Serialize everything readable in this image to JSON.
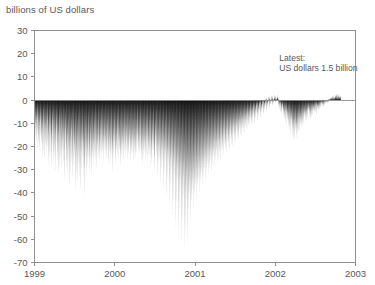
{
  "chart_data": {
    "type": "area",
    "title": "billions of US dollars",
    "xlabel": "",
    "ylabel": "billions of US dollars",
    "ylim": [
      -70,
      30
    ],
    "xlim": [
      1999,
      2003
    ],
    "grid": false,
    "legend": null,
    "yticks": [
      30,
      20,
      10,
      0,
      -10,
      -20,
      -30,
      -40,
      -50,
      -60,
      -70
    ],
    "ytick_labels": [
      "30",
      "20",
      "10",
      "0",
      "-10",
      "-20",
      "-30",
      "-40",
      "-50",
      "-60",
      "-70"
    ],
    "xticks": [
      1999,
      2000,
      2001,
      2002,
      2003
    ],
    "xtick_labels": [
      "1999",
      "2000",
      "2001",
      "2002",
      "2003"
    ],
    "series_color": "#121212",
    "axis_color": "#8e8f91",
    "text_color": "#58585a",
    "annotations": [
      {
        "name": "latest-value-annotation",
        "line1": "Latest:",
        "line2": "US dollars 1.5 billion",
        "x": 2002.05,
        "y": 17
      }
    ],
    "series": [
      {
        "name": "net position",
        "values": [
          -11.2,
          -14.6,
          -9.8,
          -17.3,
          -12.1,
          -20.4,
          -8.6,
          -15.9,
          -22.8,
          -10.3,
          -18.7,
          -13.2,
          -24.1,
          -9.4,
          -16.8,
          -21.3,
          -12.7,
          -19.5,
          -26.2,
          -14.8,
          -10.6,
          -23.4,
          -17.9,
          -13.5,
          -28.1,
          -11.9,
          -20.8,
          -15.2,
          -25.6,
          -18.3,
          -9.7,
          -22.1,
          -30.4,
          -16.5,
          -12.3,
          -27.8,
          -19.2,
          -14.1,
          -24.9,
          -31.6,
          -17.4,
          -10.9,
          -21.7,
          -29.3,
          -15.8,
          -23.2,
          -13.6,
          -26.5,
          -18.9,
          -33.1,
          -20.3,
          -12.8,
          -28.6,
          -16.2,
          -24.4,
          -35.2,
          -19.7,
          -14.5,
          -30.8,
          -22.6,
          -17.1,
          -27.3,
          -11.4,
          -32.7,
          -20.9,
          -25.1,
          -15.6,
          -29.8,
          -18.4,
          -23.7,
          -37.3,
          -21.2,
          -13.9,
          -31.5,
          -26.8,
          -19.1,
          -34.6,
          -16.7,
          -28.2,
          -22.4,
          -40.1,
          -24.3,
          -17.8,
          -33.9,
          -20.6,
          -29.4,
          -15.3,
          -36.7,
          -25.8,
          -21.1,
          -18.6,
          -31.2,
          -27.5,
          -23.9,
          -42.3,
          -19.4,
          -34.1,
          -26.2,
          -22.7,
          -38.5,
          -17.2,
          -29.9,
          -24.6,
          -20.1,
          -35.8,
          -27.1,
          -23.3,
          -41.7,
          -18.8,
          -32.4,
          -26.9,
          -21.5,
          -37.2,
          -24.8,
          -19.6,
          -30.3,
          -44.6,
          -22.9,
          -28.7,
          -25.4,
          -20.8,
          -36.1,
          -31.7,
          -23.6,
          -27.2,
          -19.9,
          -33.5,
          -26.4,
          -22.1,
          -29.6,
          -18.3,
          -24.9,
          -35.4,
          -21.7,
          -27.8,
          -23.2,
          -30.9,
          -19.2,
          -26.1,
          -22.5,
          -17.6,
          -28.3,
          -24.7,
          -20.4,
          -32.1,
          -25.9,
          -21.8,
          -18.1,
          -27.4,
          -23.8,
          -29.2,
          -19.7,
          -25.3,
          -21.2,
          -16.9,
          -26.8,
          -22.4,
          -18.6,
          -24.1,
          -20.7,
          -28.9,
          -23.5,
          -19.3,
          -25.7,
          -21.4,
          -17.8,
          -27.6,
          -22.9,
          -18.4,
          -24.3,
          -30.6,
          -20.9,
          -26.2,
          -22.1,
          -17.5,
          -28.4,
          -23.7,
          -19.8,
          -25.1,
          -21.6,
          -33.8,
          -24.5,
          -20.2,
          -27.9,
          -23.1,
          -18.9,
          -26.5,
          -22.3,
          -29.7,
          -24.8,
          -20.5,
          -16.4,
          -25.6,
          -21.9,
          -18.2,
          -27.1,
          -23.4,
          -19.5,
          -24.9,
          -31.3,
          -20.8,
          -26.7,
          -22.6,
          -18.7,
          -25.2,
          -21.3,
          -28.1,
          -24.2,
          -19.9,
          -15.8,
          -26.3,
          -22.8,
          -18.5,
          -23.9,
          -20.6,
          -27.5,
          -24.1,
          -19.2,
          -25.8,
          -21.7,
          -17.3,
          -28.6,
          -23.2,
          -19.6,
          -26.1,
          -22.4,
          -18.1,
          -24.7,
          -20.3,
          -29.4,
          -25.5,
          -21.1,
          -17.7,
          -23.6,
          -27.2,
          -19.4,
          -24.4,
          -20.9,
          -16.5,
          -26.9,
          -22.2,
          -18.8,
          -25.3,
          -21.5,
          -17.1,
          -23.8,
          -28.3,
          -19.7,
          -24.6,
          -20.1,
          -30.7,
          -26.4,
          -22.7,
          -18.3,
          -24.2,
          -20.8,
          -27.6,
          -23.1,
          -19.5,
          -25.9,
          -21.2,
          -17.4,
          -29.1,
          -24.8,
          -20.6,
          -26.2,
          -22.5,
          -18.9,
          -25.4,
          -31.8,
          -21.6,
          -27.3,
          -23.7,
          -19.1,
          -24.5,
          -20.4,
          -28.7,
          -33.2,
          -25.1,
          -21.8,
          -17.9,
          -26.6,
          -22.3,
          -35.7,
          -19.8,
          -24.9,
          -30.2,
          -21.4,
          -27.8,
          -23.5,
          -38.1,
          -19.3,
          -25.7,
          -32.6,
          -22.9,
          -28.4,
          -24.2,
          -41.3,
          -20.7,
          -26.3,
          -34.8,
          -23.1,
          -29.5,
          -25.2,
          -44.7,
          -21.9,
          -27.1,
          -37.4,
          -24.6,
          -30.8,
          -26.1,
          -48.2,
          -22.4,
          -28.9,
          -40.6,
          -25.3,
          -33.1,
          -27.7,
          -52.4,
          -23.8,
          -31.2,
          -44.9,
          -26.5,
          -35.6,
          -29.1,
          -57.3,
          -24.7,
          -33.8,
          -48.1,
          -28.2,
          -38.4,
          -31.5,
          -61.2,
          -26.9,
          -36.7,
          -51.8,
          -30.3,
          -42.1,
          -33.9,
          -64.8,
          -28.6,
          -39.2,
          -55.4,
          -32.7,
          -45.3,
          -36.1,
          -66.9,
          -30.1,
          -41.8,
          -58.2,
          -34.5,
          -47.6,
          -38.3,
          -63.1,
          -31.7,
          -43.2,
          -52.9,
          -36.4,
          -44.8,
          -39.7,
          -56.3,
          -33.2,
          -45.1,
          -48.7,
          -37.9,
          -42.6,
          -35.8,
          -50.4,
          -32.1,
          -41.3,
          -44.2,
          -36.7,
          -39.8,
          -33.4,
          -46.9,
          -30.8,
          -38.2,
          -41.6,
          -34.9,
          -37.1,
          -31.2,
          -43.4,
          -29.6,
          -35.8,
          -38.9,
          -32.3,
          -34.7,
          -28.9,
          -40.2,
          -27.4,
          -33.1,
          -36.5,
          -30.2,
          -32.8,
          -26.7,
          -37.6,
          -25.3,
          -31.4,
          -34.2,
          -28.1,
          -30.6,
          -24.8,
          -35.1,
          -23.6,
          -29.2,
          -32.4,
          -26.3,
          -28.7,
          -22.9,
          -33.5,
          -21.7,
          -27.4,
          -30.8,
          -24.6,
          -26.9,
          -21.2,
          -31.6,
          -20.4,
          -25.8,
          -28.3,
          -23.1,
          -25.2,
          -19.8,
          -29.7,
          -18.6,
          -24.1,
          -26.8,
          -21.5,
          -23.6,
          -18.2,
          -27.9,
          -17.4,
          -22.8,
          -25.1,
          -20.3,
          -22.1,
          -16.9,
          -26.2,
          -16.1,
          -21.4,
          -23.7,
          -18.8,
          -20.6,
          -15.7,
          -24.8,
          -14.9,
          -19.8,
          -22.3,
          -17.4,
          -19.1,
          -14.3,
          -23.1,
          -13.6,
          -18.2,
          -20.9,
          -16.1,
          -17.8,
          -13.1,
          -21.7,
          -12.4,
          -16.8,
          -19.4,
          -14.7,
          -16.3,
          -11.8,
          -20.2,
          -11.2,
          -15.4,
          -17.9,
          -13.2,
          -14.9,
          -10.6,
          -18.7,
          -10.1,
          -14.1,
          -16.3,
          -11.8,
          -13.4,
          -9.3,
          -17.2,
          -8.7,
          -12.6,
          -14.8,
          -10.4,
          -12.1,
          -8.1,
          -15.6,
          -7.4,
          -11.2,
          -13.3,
          -9.1,
          -10.7,
          -6.8,
          -14.1,
          -6.2,
          -9.8,
          -11.9,
          -7.6,
          -9.3,
          -5.4,
          -12.6,
          -4.9,
          -8.4,
          -10.2,
          -6.3,
          -7.9,
          -4.1,
          -11.1,
          -3.6,
          -7.1,
          -8.8,
          -5.2,
          -6.4,
          -2.8,
          -9.6,
          -2.3,
          -5.8,
          -7.3,
          -3.9,
          -5.1,
          -1.6,
          -8.2,
          -1.2,
          -4.4,
          -5.9,
          -2.6,
          -3.8,
          -0.4,
          -6.7,
          -0.8,
          -3.1,
          -4.6,
          -1.4,
          -2.3,
          0.6,
          -5.2,
          0.9,
          -1.8,
          -3.2,
          -0.3,
          -1.1,
          1.8,
          -3.8,
          1.4,
          -0.6,
          -2.1,
          0.8,
          0.2,
          2.3,
          -2.4,
          1.9,
          0.4,
          -1.3,
          1.2,
          0.7,
          2.6,
          -1.1,
          2.1,
          0.9,
          -0.5,
          1.6,
          1.1,
          2.4,
          -2.6,
          0.3,
          -1.9,
          -4.2,
          -1.2,
          -2.8,
          -5.6,
          -3.1,
          -6.9,
          -4.3,
          -2.1,
          -7.8,
          -5.2,
          -3.6,
          -9.1,
          -6.4,
          -4.8,
          -10.3,
          -7.2,
          -5.1,
          -11.6,
          -8.3,
          -6.2,
          -12.8,
          -9.4,
          -7.1,
          -14.2,
          -10.6,
          -8.2,
          -15.7,
          -11.3,
          -9.1,
          -16.9,
          -12.4,
          -10.2,
          -18.3,
          -13.6,
          -11.1,
          -19.4,
          -14.2,
          -12.3,
          -17.8,
          -13.1,
          -10.8,
          -16.4,
          -12.7,
          -9.8,
          -15.2,
          -11.6,
          -8.9,
          -14.3,
          -10.9,
          -8.1,
          -13.1,
          -9.7,
          -7.3,
          -12.2,
          -8.8,
          -6.4,
          -11.3,
          -7.9,
          -5.8,
          -10.4,
          -7.1,
          -5.2,
          -9.6,
          -6.3,
          -4.6,
          -8.7,
          -5.7,
          -4.1,
          -7.8,
          -5.1,
          -3.4,
          -9.3,
          -6.6,
          -4.9,
          -8.2,
          -5.4,
          -3.8,
          -7.1,
          -4.6,
          -3.1,
          -6.3,
          -4.1,
          -2.6,
          -5.4,
          -3.6,
          -2.1,
          -6.8,
          -4.4,
          -2.9,
          -5.1,
          -3.2,
          -1.8,
          -4.3,
          -2.7,
          -1.4,
          -3.6,
          -2.2,
          -1.1,
          -2.9,
          -1.7,
          -0.6,
          -3.2,
          -1.9,
          -0.8,
          -2.4,
          -1.3,
          -0.3,
          -1.8,
          -0.9,
          0.2,
          -1.4,
          -0.5,
          0.6,
          -1.1,
          -0.2,
          0.9,
          0.4,
          1.2,
          0.7,
          1.6,
          1.1,
          0.5,
          1.9,
          1.4,
          0.8,
          2.2,
          1.7,
          1.1,
          2.6,
          2.1,
          1.3,
          2.9,
          2.4,
          1.6,
          3.1,
          2.2,
          1.5,
          2.7,
          1.9,
          1.2,
          2.4,
          1.7,
          1.5
        ]
      }
    ]
  }
}
